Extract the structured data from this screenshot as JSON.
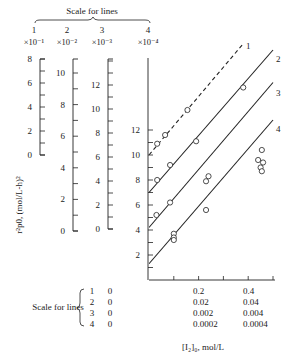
{
  "chart_data": {
    "type": "scatter",
    "title": "",
    "ylabel": "r_p0^2, (mol/L-h)^2",
    "xlabel": "[I2]0, mol/L",
    "top_scale_title": "Scale for lines",
    "bottom_scale_title": "Scale for lines",
    "y_scales": [
      {
        "line": "1",
        "multiplier": "×10⁻¹",
        "ticks": [
          0,
          2,
          4,
          6,
          8
        ],
        "range": [
          0,
          8
        ]
      },
      {
        "line": "2",
        "multiplier": "×10⁻²",
        "ticks": [
          0,
          2,
          4,
          6,
          8,
          10
        ],
        "range": [
          0,
          10
        ]
      },
      {
        "line": "3",
        "multiplier": "×10⁻³",
        "ticks": [
          0,
          2,
          4,
          6,
          8,
          10,
          12
        ],
        "range": [
          0,
          13
        ]
      },
      {
        "line": "4",
        "multiplier": "×10⁻⁴",
        "ticks": [
          2,
          4,
          6,
          8,
          10,
          12
        ],
        "range": [
          0,
          18
        ]
      }
    ],
    "x_scales": [
      {
        "line": "1",
        "ticks": [
          "0",
          "0.2",
          "0.4"
        ]
      },
      {
        "line": "2",
        "ticks": [
          "0",
          "0.02",
          "0.04"
        ]
      },
      {
        "line": "3",
        "ticks": [
          "0",
          "0.002",
          "0.004"
        ]
      },
      {
        "line": "4",
        "ticks": [
          "0",
          "0.0002",
          "0.0004"
        ]
      }
    ],
    "x_range_normalized": [
      0,
      0.5
    ],
    "series": [
      {
        "name": "1",
        "style": "dashed",
        "fit": {
          "intercept": 10.0,
          "end": [
            0.38,
            18.9
          ]
        },
        "points": [
          [
            0.033,
            10.9
          ],
          [
            0.065,
            11.6
          ],
          [
            0.155,
            13.6
          ]
        ]
      },
      {
        "name": "2",
        "style": "solid",
        "fit": {
          "intercept": 7.0,
          "end": [
            0.5,
            18.4
          ]
        },
        "points": [
          [
            0.033,
            8.0
          ],
          [
            0.085,
            9.2
          ],
          [
            0.19,
            11.1
          ],
          [
            0.38,
            15.4
          ]
        ]
      },
      {
        "name": "3",
        "style": "solid",
        "fit": {
          "intercept": 4.2,
          "end": [
            0.5,
            15.8
          ]
        },
        "points": [
          [
            0.03,
            5.2
          ],
          [
            0.085,
            6.2
          ],
          [
            0.23,
            7.9
          ],
          [
            0.24,
            8.3
          ]
        ]
      },
      {
        "name": "4",
        "style": "solid",
        "fit": {
          "intercept": 1.3,
          "end": [
            0.5,
            12.8
          ]
        },
        "points": [
          [
            0.1,
            3.7
          ],
          [
            0.1,
            3.4
          ],
          [
            0.1,
            3.2
          ],
          [
            0.23,
            5.6
          ],
          [
            0.45,
            9.0
          ],
          [
            0.455,
            8.7
          ],
          [
            0.46,
            9.4
          ],
          [
            0.44,
            9.6
          ],
          [
            0.455,
            10.4
          ]
        ]
      }
    ],
    "grid": false,
    "legend": "line numbers labeled at line ends"
  },
  "labels": {
    "top_scale_title": "Scale for lines",
    "bottom_scale_title": "Scale for lines",
    "ylabel": "r²p0, (mol/L-h)²",
    "xlabel": "[I₂]₀, mol/L"
  }
}
